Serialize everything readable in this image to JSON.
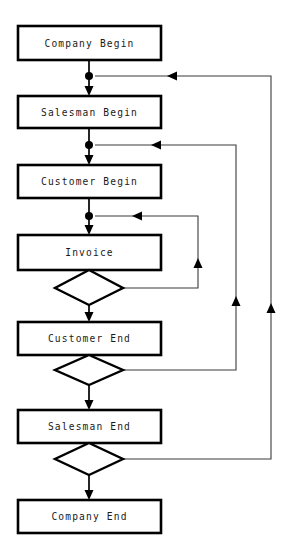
{
  "diagram": {
    "type": "flowchart",
    "canvas": {
      "width": 284,
      "height": 544,
      "background": "#ffffff"
    },
    "colors": {
      "stroke": "#000000",
      "loop_stroke": "#3b3b3b",
      "fill": "#ffffff",
      "text": "#1a1a1a"
    },
    "nodes": [
      {
        "id": "company-begin",
        "label": "Company Begin",
        "shape": "process",
        "x": 18,
        "y": 26,
        "w": 143,
        "h": 34
      },
      {
        "id": "salesman-begin",
        "label": "Salesman Begin",
        "shape": "process",
        "x": 18,
        "y": 96,
        "w": 143,
        "h": 32
      },
      {
        "id": "customer-begin",
        "label": "Customer Begin",
        "shape": "process",
        "x": 18,
        "y": 165,
        "w": 143,
        "h": 33
      },
      {
        "id": "invoice",
        "label": "Invoice",
        "shape": "process",
        "x": 18,
        "y": 235,
        "w": 143,
        "h": 35
      },
      {
        "id": "customer-end",
        "label": "Customer End",
        "shape": "process",
        "x": 18,
        "y": 322,
        "w": 143,
        "h": 33
      },
      {
        "id": "salesman-end",
        "label": "Salesman End",
        "shape": "process",
        "x": 18,
        "y": 410,
        "w": 143,
        "h": 33
      },
      {
        "id": "company-end",
        "label": "Company End",
        "shape": "process",
        "x": 18,
        "y": 500,
        "w": 143,
        "h": 33
      }
    ],
    "decisions": [
      {
        "id": "invoice-decision",
        "label": "",
        "shape": "decision",
        "cx": 89,
        "top": 270,
        "bottom": 305,
        "halfw": 34
      },
      {
        "id": "customer-end-decision",
        "label": "",
        "shape": "decision",
        "cx": 89,
        "top": 355,
        "bottom": 385,
        "halfw": 34
      },
      {
        "id": "salesman-end-decision",
        "label": "",
        "shape": "decision",
        "cx": 89,
        "top": 443,
        "bottom": 475,
        "halfw": 34
      }
    ],
    "junctions": [
      {
        "id": "junction-salesman",
        "cx": 89,
        "cy": 76,
        "r": 4
      },
      {
        "id": "junction-customer",
        "cx": 89,
        "cy": 145,
        "r": 4
      },
      {
        "id": "junction-invoice",
        "cx": 89,
        "cy": 216,
        "r": 4
      }
    ],
    "edges": [
      {
        "id": "edge-company-begin-to-salesman-begin",
        "from": "company-begin",
        "to": "salesman-begin",
        "kind": "main"
      },
      {
        "id": "edge-salesman-begin-to-customer-begin",
        "from": "salesman-begin",
        "to": "customer-begin",
        "kind": "main"
      },
      {
        "id": "edge-customer-begin-to-invoice",
        "from": "customer-begin",
        "to": "invoice",
        "kind": "main"
      },
      {
        "id": "edge-invoice-decision-to-customer-end",
        "from": "invoice-decision",
        "to": "customer-end",
        "kind": "main"
      },
      {
        "id": "edge-customer-end-decision-to-salesman-end",
        "from": "customer-end-decision",
        "to": "salesman-end",
        "kind": "main"
      },
      {
        "id": "edge-salesman-end-decision-to-company-end",
        "from": "salesman-end-decision",
        "to": "company-end",
        "kind": "main"
      },
      {
        "id": "loop-invoice",
        "from": "invoice-decision",
        "to": "junction-invoice",
        "kind": "loop",
        "track_x": 198
      },
      {
        "id": "loop-customer",
        "from": "customer-end-decision",
        "to": "junction-customer",
        "kind": "loop",
        "track_x": 236
      },
      {
        "id": "loop-salesman",
        "from": "salesman-end-decision",
        "to": "junction-salesman",
        "kind": "loop",
        "track_x": 271
      }
    ]
  }
}
